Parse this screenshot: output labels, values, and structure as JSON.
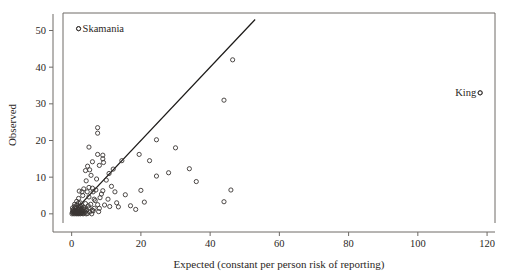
{
  "figure": {
    "title": "",
    "background": "#ffffff",
    "frame_color": "#6e6a66",
    "marker_color": "#3a3633",
    "line_color": "#1c1a18"
  },
  "chart_data": {
    "type": "scatter",
    "title": "",
    "xlabel": "Expected (constant per person risk of reporting)",
    "ylabel": "Observed",
    "xlim": [
      -2.5,
      122
    ],
    "ylim": [
      -2.5,
      54.5
    ],
    "xticks": [
      0,
      20,
      40,
      60,
      80,
      100,
      120
    ],
    "xticklabels": [
      "0",
      "20",
      "40",
      "60",
      "80",
      "100",
      "120"
    ],
    "yticks": [
      0,
      10,
      20,
      30,
      40,
      50
    ],
    "yticklabels": [
      "0",
      "10",
      "20",
      "30",
      "40",
      "50"
    ],
    "grid": false,
    "legend": "none",
    "reference_line": {
      "label": "y = x identity line",
      "x0": 0,
      "y0": 0,
      "x1": 53,
      "y1": 53,
      "slope": 1,
      "intercept": 0
    },
    "annotations": [
      {
        "text": "Skamania",
        "x": 2.0,
        "y": 50.5,
        "marker_x": 2.0,
        "marker_y": 50.5,
        "text_anchor": "start",
        "dx": 4,
        "dy": 3.5
      },
      {
        "text": "King",
        "x": 118.0,
        "y": 33.0,
        "marker_x": 118.0,
        "marker_y": 33.0,
        "text_anchor": "end",
        "dx": -4,
        "dy": 3.5
      }
    ],
    "points": [
      [
        2.0,
        50.5
      ],
      [
        46.5,
        42.0
      ],
      [
        44.0,
        31.0
      ],
      [
        118.0,
        33.0
      ],
      [
        7.5,
        23.5
      ],
      [
        7.5,
        22.0
      ],
      [
        24.5,
        20.2
      ],
      [
        5.0,
        18.2
      ],
      [
        30.0,
        18.0
      ],
      [
        19.5,
        16.2
      ],
      [
        7.5,
        16.2
      ],
      [
        9.0,
        16.0
      ],
      [
        9.0,
        15.0
      ],
      [
        6.0,
        14.2
      ],
      [
        9.2,
        14.0
      ],
      [
        8.0,
        13.2
      ],
      [
        22.5,
        14.5
      ],
      [
        12.0,
        12.2
      ],
      [
        5.2,
        12.0
      ],
      [
        4.0,
        11.8
      ],
      [
        28.0,
        11.2
      ],
      [
        34.0,
        12.3
      ],
      [
        24.5,
        10.3
      ],
      [
        10.0,
        9.2
      ],
      [
        4.2,
        9.0
      ],
      [
        36.0,
        8.8
      ],
      [
        5.0,
        7.2
      ],
      [
        6.0,
        7.0
      ],
      [
        3.5,
        6.8
      ],
      [
        7.0,
        6.5
      ],
      [
        9.0,
        6.3
      ],
      [
        2.2,
        6.2
      ],
      [
        3.0,
        6.0
      ],
      [
        4.5,
        6.0
      ],
      [
        6.2,
        6.0
      ],
      [
        20.0,
        6.4
      ],
      [
        46.0,
        6.5
      ],
      [
        15.5,
        5.2
      ],
      [
        3.2,
        5.0
      ],
      [
        5.0,
        4.6
      ],
      [
        8.2,
        4.4
      ],
      [
        2.0,
        4.2
      ],
      [
        6.5,
        4.0
      ],
      [
        10.5,
        4.0
      ],
      [
        44.0,
        3.3
      ],
      [
        21.0,
        3.2
      ],
      [
        13.0,
        3.0
      ],
      [
        2.5,
        3.0
      ],
      [
        4.0,
        2.8
      ],
      [
        5.5,
        2.6
      ],
      [
        7.5,
        2.5
      ],
      [
        9.5,
        2.4
      ],
      [
        1.5,
        2.4
      ],
      [
        3.0,
        2.2
      ],
      [
        11.0,
        2.0
      ],
      [
        13.5,
        1.9
      ],
      [
        0.8,
        2.0
      ],
      [
        2.0,
        1.8
      ],
      [
        3.5,
        1.7
      ],
      [
        5.0,
        1.6
      ],
      [
        6.5,
        1.5
      ],
      [
        8.0,
        1.5
      ],
      [
        1.2,
        1.4
      ],
      [
        2.4,
        1.3
      ],
      [
        3.8,
        1.2
      ],
      [
        0.5,
        1.2
      ],
      [
        1.8,
        1.1
      ],
      [
        2.8,
        1.0
      ],
      [
        4.4,
        1.0
      ],
      [
        6.0,
        1.0
      ],
      [
        0.3,
        0.9
      ],
      [
        1.0,
        0.9
      ],
      [
        1.6,
        0.8
      ],
      [
        2.2,
        0.8
      ],
      [
        3.2,
        0.7
      ],
      [
        0.6,
        0.6
      ],
      [
        1.4,
        0.6
      ],
      [
        2.0,
        0.5
      ],
      [
        2.6,
        0.5
      ],
      [
        4.0,
        0.5
      ],
      [
        5.2,
        0.5
      ],
      [
        0.2,
        0.4
      ],
      [
        0.9,
        0.4
      ],
      [
        1.5,
        0.3
      ],
      [
        2.1,
        0.3
      ],
      [
        2.9,
        0.3
      ],
      [
        3.6,
        0.2
      ],
      [
        0.4,
        0.2
      ],
      [
        1.1,
        0.2
      ],
      [
        1.7,
        0.1
      ],
      [
        2.3,
        0.1
      ],
      [
        3.0,
        0.1
      ],
      [
        4.6,
        0.1
      ],
      [
        0.1,
        0.0
      ],
      [
        0.7,
        0.0
      ],
      [
        1.3,
        0.0
      ],
      [
        1.9,
        0.0
      ],
      [
        2.5,
        0.0
      ],
      [
        3.3,
        0.0
      ],
      [
        4.2,
        0.0
      ],
      [
        5.8,
        0.0
      ],
      [
        0.25,
        1.6
      ],
      [
        0.85,
        2.6
      ],
      [
        1.45,
        3.4
      ],
      [
        2.05,
        1.15
      ],
      [
        2.65,
        1.95
      ],
      [
        3.45,
        0.85
      ],
      [
        1.05,
        1.75
      ],
      [
        1.95,
        2.95
      ],
      [
        0.55,
        0.75
      ],
      [
        2.35,
        2.15
      ],
      [
        3.05,
        1.45
      ],
      [
        4.8,
        2.2
      ],
      [
        6.8,
        3.6
      ],
      [
        8.6,
        5.4
      ],
      [
        11.5,
        7.5
      ],
      [
        14.5,
        14.5
      ],
      [
        5.6,
        10.5
      ],
      [
        4.6,
        13.0
      ],
      [
        10.8,
        11.0
      ],
      [
        7.2,
        9.5
      ],
      [
        12.5,
        6.0
      ],
      [
        17.0,
        2.2
      ],
      [
        18.5,
        1.2
      ],
      [
        6.2,
        0.8
      ],
      [
        7.8,
        0.6
      ]
    ]
  }
}
